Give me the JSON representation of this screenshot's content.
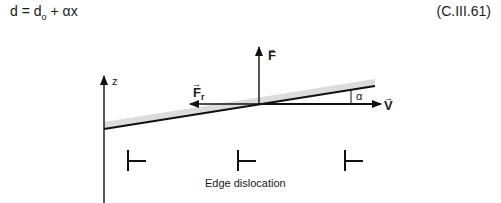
{
  "equation": {
    "lhs": "d",
    "equals": "=",
    "d0_base": "d",
    "d0_sub": "o",
    "plus": "+",
    "alpha": "α",
    "x": "x",
    "number": "(C.III.61)"
  },
  "diagram": {
    "axis_label": "z",
    "force_label": "F",
    "friction_label": "F",
    "friction_sub": "r",
    "velocity_label": "V",
    "angle_label": "α",
    "vector_arrow": "→",
    "dislocation_symbol": "⊥",
    "caption": "Edge dislocation",
    "dislocation_count": 3
  }
}
